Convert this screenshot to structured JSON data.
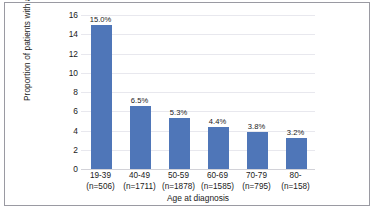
{
  "figure": {
    "background_color": "#ffffff",
    "border_color": "#9a9aa2"
  },
  "chart_data": {
    "type": "bar",
    "title": "",
    "xlabel": "Age at diagnosis",
    "ylabel": "Proportion of patients with a pathogenic variant",
    "categories": [
      "19-39",
      "40-49",
      "50-59",
      "60-69",
      "70-79",
      "80-"
    ],
    "group_counts": [
      "(n=506)",
      "(n=1711)",
      "(n=1878)",
      "(n=1585)",
      "(n=795)",
      "(n=158)"
    ],
    "values": [
      15.0,
      6.5,
      5.3,
      4.4,
      3.8,
      3.2
    ],
    "value_labels": [
      "15.0%",
      "6.5%",
      "5.3%",
      "4.4%",
      "3.8%",
      "3.2%"
    ],
    "ylim": [
      0,
      16
    ],
    "yticks": [
      16,
      14,
      12,
      10,
      8,
      6,
      4,
      2,
      0
    ],
    "ytick_labels": [
      "16",
      "14",
      "12",
      "10",
      "8",
      "6",
      "4",
      "2",
      "0"
    ],
    "grid": "horizontal",
    "legend": "none",
    "bar_color": "#4f76b8",
    "gridline_color": "#e8e8ee"
  }
}
